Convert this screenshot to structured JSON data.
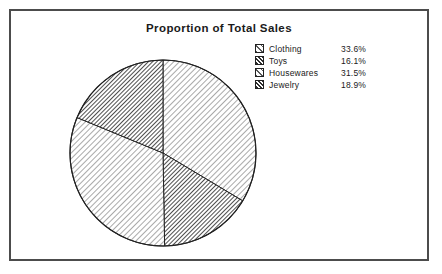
{
  "chart_data": {
    "type": "pie",
    "title": "Proportion of Total Sales",
    "xlabel": "",
    "ylabel": "",
    "legend_position": "top-right",
    "grid": false,
    "start_angle_deg": 0,
    "direction": "clockwise",
    "categories": [
      "Clothing",
      "Toys",
      "Housewares",
      "Jewelry"
    ],
    "values": [
      33.6,
      16.1,
      31.5,
      18.9
    ],
    "value_labels": [
      "33.6%",
      "16.1%",
      "31.5%",
      "18.9%"
    ],
    "units": "percent",
    "slices": [
      {
        "label": "Clothing",
        "value": 33.6,
        "value_label": "33.6%",
        "pattern": "diagonal-hatch-light",
        "angle_deg": 121.0,
        "start_deg": 0.0,
        "end_deg": 121.0
      },
      {
        "label": "Toys",
        "value": 16.1,
        "value_label": "16.1%",
        "pattern": "diagonal-hatch-dark",
        "angle_deg": 58.0,
        "start_deg": 121.0,
        "end_deg": 179.0
      },
      {
        "label": "Housewares",
        "value": 31.5,
        "value_label": "31.5%",
        "pattern": "diagonal-hatch-light",
        "angle_deg": 113.4,
        "start_deg": 179.0,
        "end_deg": 292.4
      },
      {
        "label": "Jewelry",
        "value": 18.9,
        "value_label": "18.9%",
        "pattern": "diagonal-hatch-dark",
        "angle_deg": 68.0,
        "start_deg": 292.4,
        "end_deg": 360.0
      }
    ]
  },
  "colors": {
    "frame_border": "#4c4c4c",
    "background": "#ffffff",
    "text": "#1a1a1a",
    "hatch_light": "#555555",
    "hatch_dark": "#333333",
    "slice_outline": "#222222"
  }
}
